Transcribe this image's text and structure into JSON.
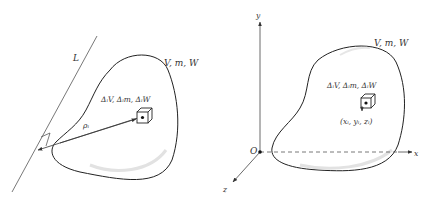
{
  "figure_left": {
    "line_label": "L",
    "body_label": "V, m, W",
    "element_label": "ΔᵢV, Δᵢm, ΔᵢW",
    "distance_label": "ρᵢ"
  },
  "figure_right": {
    "axis_y": "y",
    "axis_x": "x",
    "axis_z": "z",
    "origin": "O",
    "body_label": "V, m, W",
    "element_label": "ΔᵢV, Δᵢm, ΔᵢW",
    "coordinates_label": "(xᵢ, yᵢ, zᵢ)"
  },
  "colors": {
    "stroke": "#333333",
    "shading": "#d8d8d8",
    "axis": "#444444"
  }
}
